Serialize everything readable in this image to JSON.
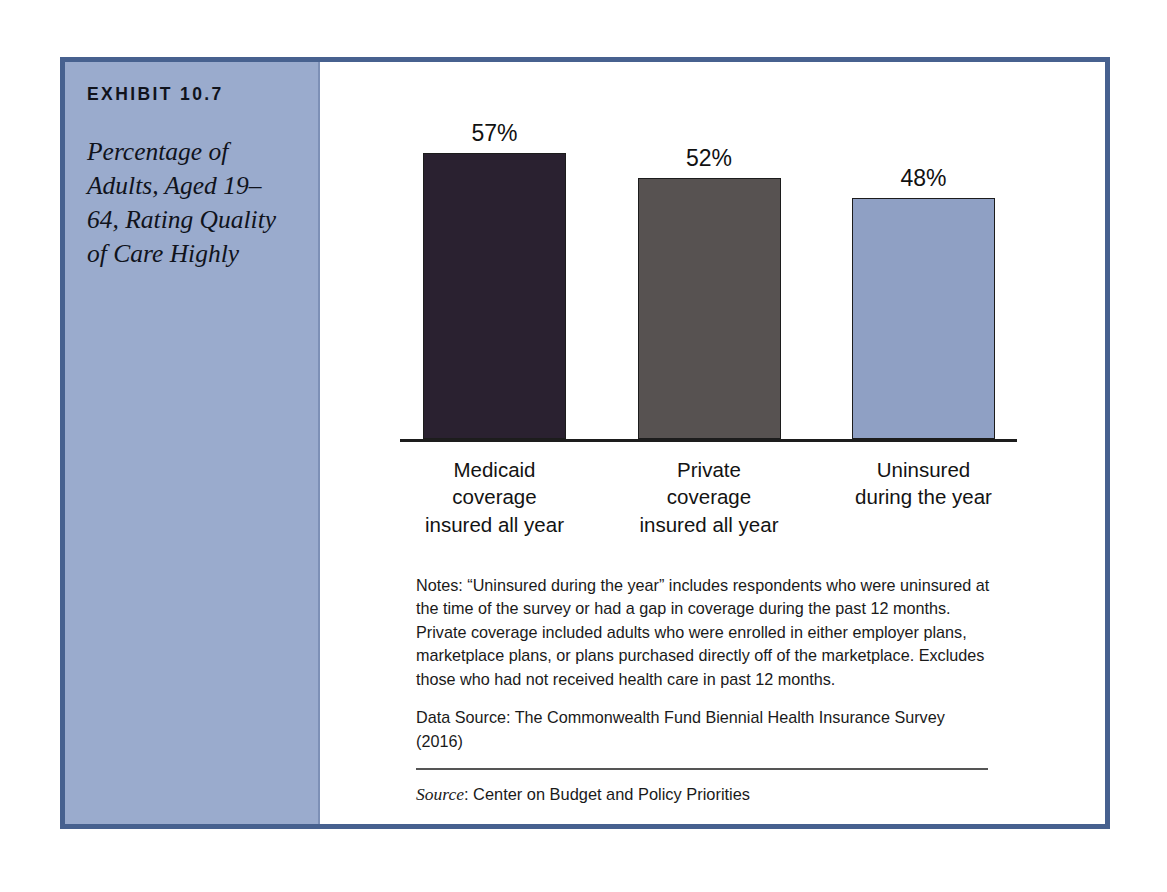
{
  "sidebar": {
    "exhibit_number": "EXHIBIT 10.7",
    "exhibit_title": "Percentage of Adults, Aged 19–64, Rating Quality of Care Highly"
  },
  "chart_data": {
    "type": "bar",
    "title": "Percentage of Adults, Aged 19–64, Rating Quality of Care Highly",
    "categories": [
      "Medicaid coverage insured all year",
      "Private coverage insured all year",
      "Uninsured during the year"
    ],
    "values": [
      57,
      52,
      48
    ],
    "value_labels": [
      "57%",
      "52%",
      "48%"
    ],
    "bar_colors": [
      "#2a2130",
      "#575251",
      "#8fa0c4"
    ],
    "xlabel": "",
    "ylabel": "",
    "ylim": [
      0,
      62
    ],
    "grid": false,
    "legend": "none",
    "axis_visible": "x-baseline-only"
  },
  "notes": {
    "note_text": "Notes: “Uninsured during the year” includes respondents who were uninsured at the time of the survey or had a gap in coverage during the past 12 months. Private coverage included adults who were enrolled in either employer plans, marketplace plans, or plans purchased directly off of the marketplace. Excludes those who had not received health care in past 12 months.",
    "data_source_text": "Data Source: The Commonwealth Fund Biennial Health Insurance Survey (2016)",
    "source_label": "Source",
    "source_text": ": Center on Budget and Policy Priorities"
  },
  "colors": {
    "frame_border": "#47618f",
    "sidebar_background": "#9aabcd",
    "bar_dark": "#2a2130",
    "bar_gray": "#575251",
    "bar_blue": "#8fa0c4"
  }
}
